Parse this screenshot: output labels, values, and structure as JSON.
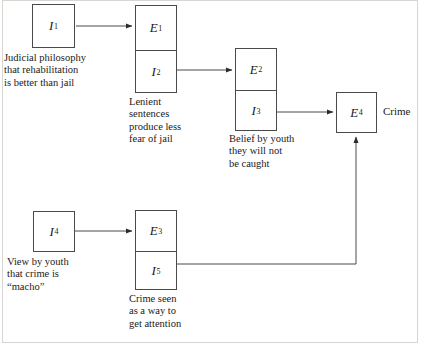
{
  "figure": {
    "frame_color": "#d8d6d2",
    "line_color": "#4a4a4a"
  },
  "nodes": {
    "i1": {
      "label": "I",
      "sub": "1"
    },
    "e1": {
      "label": "E",
      "sub": "1"
    },
    "i2": {
      "label": "I",
      "sub": "2"
    },
    "e2": {
      "label": "E",
      "sub": "2"
    },
    "i3": {
      "label": "I",
      "sub": "3"
    },
    "e4": {
      "label": "E",
      "sub": "4"
    },
    "i4": {
      "label": "I",
      "sub": "4"
    },
    "e3": {
      "label": "E",
      "sub": "3"
    },
    "i5": {
      "label": "I",
      "sub": "5"
    }
  },
  "captions": {
    "i1": "Judicial philosophy\nthat rehabilitation\nis better than jail",
    "i2": "Lenient\nsentences\nproduce less\nfear of jail",
    "i3": "Belief by youth\nthey will not\nbe caught",
    "i4": "View by youth\nthat crime is\n“macho”",
    "i5": "Crime seen\nas a way to\nget attention"
  },
  "labels": {
    "e4_outcome": "Crime"
  },
  "arrows": [
    {
      "name": "i1-to-e1",
      "from": "i1",
      "to": "e1"
    },
    {
      "name": "i2-to-e2",
      "from": "i2",
      "to": "e2"
    },
    {
      "name": "i3-to-e4",
      "from": "i3",
      "to": "e4"
    },
    {
      "name": "i4-to-e3",
      "from": "i4",
      "to": "e3"
    },
    {
      "name": "i5-to-e4",
      "from": "i5",
      "to": "e4"
    }
  ]
}
